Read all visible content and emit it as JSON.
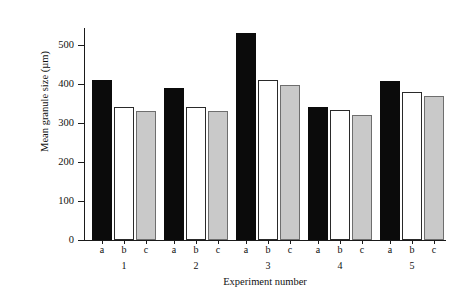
{
  "chart_data": {
    "type": "bar",
    "title": "",
    "xlabel": "Experiment number",
    "ylabel": "Mean granule size (µm)",
    "ylim": [
      0,
      550
    ],
    "yticks": [
      0,
      100,
      200,
      300,
      400,
      500
    ],
    "ytick_labels": [
      "0",
      "100",
      "200",
      "300",
      "400",
      "500"
    ],
    "grid": false,
    "legend": "none",
    "categories": [
      "1",
      "2",
      "3",
      "4",
      "5"
    ],
    "subcategories": [
      "a",
      "b",
      "c"
    ],
    "series": [
      {
        "name": "a",
        "color": "#0b0b0b",
        "fill": "black",
        "values": [
          410,
          390,
          532,
          340,
          408
        ]
      },
      {
        "name": "b",
        "color": "#ffffff",
        "fill": "white",
        "values": [
          342,
          340,
          410,
          334,
          380
        ]
      },
      {
        "name": "c",
        "color": "#c9c9c9",
        "fill": "light-gray",
        "values": [
          330,
          330,
          398,
          320,
          368
        ]
      }
    ],
    "bar_labels": [
      [
        "a",
        "b",
        "c"
      ],
      [
        "a",
        "b",
        "c"
      ],
      [
        "a",
        "b",
        "c"
      ],
      [
        "a",
        "b",
        "c"
      ],
      [
        "a",
        "b",
        "c"
      ]
    ]
  }
}
